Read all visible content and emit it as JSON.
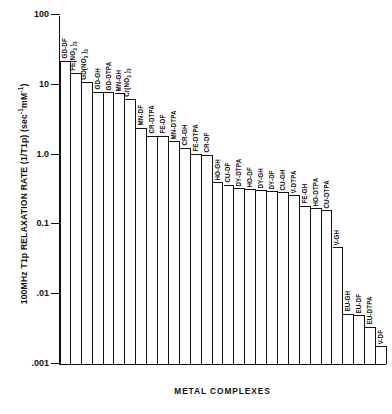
{
  "chart_data": {
    "type": "bar",
    "title": "",
    "xlabel": "METAL COMPLEXES",
    "ylabel": "100MHz T1p RELAXATION RATE (1/T1p) (sec-1mM-1)",
    "ylabel_parts": {
      "lead": "100MHz T1p RELAXATION RATE (1/T1p) (sec",
      "sup1": "-1",
      "mid": "mM",
      "sup2": "-1",
      "tail": ")"
    },
    "yscale": "log",
    "ylim": [
      0.001,
      100
    ],
    "grid": false,
    "legend": "none",
    "ytick_labels": [
      "100",
      "10",
      "1.0",
      "0.1",
      ".01",
      ".001"
    ],
    "ytick_values": [
      100,
      10,
      1.0,
      0.1,
      0.01,
      0.001
    ],
    "categories": [
      "GD-DF",
      "FE(NO3)3",
      "GD(NO3)3",
      "GD-GH",
      "GD-DTPA",
      "MN-GH",
      "Cr(NO3)3",
      "MN-DF",
      "CR-DTPA",
      "FE-DF",
      "MN-DTPA",
      "CR-GH",
      "FE-DTPA",
      "CR-DF",
      "HO-GH",
      "CU-DF",
      "DY-DTPA",
      "HO-DF",
      "DY-GH",
      "DY-DF",
      "CU-GH",
      "V-DTPA",
      "FE-GH",
      "HO-DTPA",
      "CU-DTPA",
      "V-GH",
      "EU-GH",
      "EU-DF",
      "EU-DTPA",
      "V-DF"
    ],
    "category_labels_rich": [
      {
        "text": "GD-DF"
      },
      {
        "text": "FE(NO",
        "sub": "3",
        "tail": " )",
        "sub2": "3"
      },
      {
        "text": "GD(NO",
        "sub": "3",
        "tail": " )",
        "sub2": "3"
      },
      {
        "text": "GD-GH"
      },
      {
        "text": "GD-DTPA"
      },
      {
        "text": "MN-GH"
      },
      {
        "text": "Cr(NO",
        "sub": "3",
        "tail": " )",
        "sub2": "3"
      },
      {
        "text": "MN-DF"
      },
      {
        "text": "CR-DTPA"
      },
      {
        "text": "FE-DF"
      },
      {
        "text": "MN-DTPA"
      },
      {
        "text": "CR-GH"
      },
      {
        "text": "FE-DTPA"
      },
      {
        "text": "CR-DF"
      },
      {
        "text": "HO-GH"
      },
      {
        "text": "CU-DF"
      },
      {
        "text": "DY-DTPA"
      },
      {
        "text": "HO-DF"
      },
      {
        "text": "DY-GH"
      },
      {
        "text": "DY-DF"
      },
      {
        "text": "CU-GH"
      },
      {
        "text": "V-DTPA"
      },
      {
        "text": "FE-GH"
      },
      {
        "text": "HO-DTPA"
      },
      {
        "text": "CU-DTPA"
      },
      {
        "text": "V-GH"
      },
      {
        "text": "EU-GH"
      },
      {
        "text": "EU-DF"
      },
      {
        "text": "EU-DTPA"
      },
      {
        "text": "V-DF"
      }
    ],
    "values": [
      22,
      15,
      11,
      8.0,
      7.8,
      7.6,
      6.2,
      2.4,
      1.85,
      1.85,
      1.55,
      1.25,
      1.02,
      1.0,
      0.4,
      0.37,
      0.33,
      0.32,
      0.31,
      0.3,
      0.29,
      0.26,
      0.185,
      0.17,
      0.16,
      0.047,
      0.0052,
      0.005,
      0.0034,
      0.0018
    ]
  },
  "axis": {
    "x_title": "METAL COMPLEXES"
  }
}
